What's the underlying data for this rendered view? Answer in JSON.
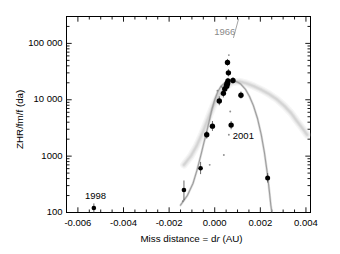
{
  "figure": {
    "background": "#ffffff",
    "frame_color": "#000000",
    "point_color": "#000000",
    "model_curve_dark": "#9a9a9a",
    "model_curve_light": "#cfcfcf"
  },
  "chart_data": {
    "type": "scatter",
    "title": "",
    "xlabel": "Miss distance = dr (AU)",
    "xlabel_parts": {
      "pre": "Miss distance = d",
      "italic": "r",
      "post": " (AU)"
    },
    "ylabel": "ZHR/fm/f (da)",
    "xscale": "linear",
    "yscale": "log",
    "xlim": [
      -0.0065,
      0.0042
    ],
    "ylim": [
      100,
      300000
    ],
    "grid": false,
    "legend": "none",
    "xticks": [
      -0.006,
      -0.004,
      -0.002,
      0.0,
      0.002,
      0.004
    ],
    "xticklabels": [
      "-0.006",
      "-0.004",
      "-0.002",
      "0.000",
      "0.002",
      "0.004"
    ],
    "x_minor_per_major": 4,
    "yticks": [
      100,
      1000,
      10000,
      100000
    ],
    "yticklabels": [
      "100",
      "1000",
      "10 000",
      "100 000"
    ],
    "tick_direction": "in",
    "series": [
      {
        "name": "Observed storms (ZHR measurements)",
        "marker": "filled circle",
        "color": "#000000",
        "points": [
          {
            "x": -0.0053,
            "y": 120,
            "size": 4.6,
            "err_lo": 100,
            "err_hi": 145
          },
          {
            "x": -0.00135,
            "y": 250,
            "size": 4.6,
            "err_lo": 165,
            "err_hi": 370
          },
          {
            "x": -0.00062,
            "y": 610,
            "size": 4.6,
            "err_lo": 480,
            "err_hi": 790
          },
          {
            "x": -0.00035,
            "y": 2400,
            "size": 5.4,
            "err_lo": 2050,
            "err_hi": 2800
          },
          {
            "x": -0.0001,
            "y": 3400,
            "size": 5.4,
            "err_lo": 2800,
            "err_hi": 4200
          },
          {
            "x": 0.0002,
            "y": 9500,
            "size": 5.4,
            "err_lo": 8000,
            "err_hi": 11500
          },
          {
            "x": 0.00038,
            "y": 13000,
            "size": 5.4,
            "err_lo": 11000,
            "err_hi": 15500
          },
          {
            "x": 0.00044,
            "y": 15500,
            "size": 5.4,
            "err_lo": 13500,
            "err_hi": 18000
          },
          {
            "x": 0.00052,
            "y": 17500,
            "size": 6.0,
            "err_lo": 15000,
            "err_hi": 20500
          },
          {
            "x": 0.00055,
            "y": 19500,
            "size": 6.0,
            "err_lo": 17000,
            "err_hi": 22500
          },
          {
            "x": 0.00058,
            "y": 21500,
            "size": 5.4,
            "err_lo": 19000,
            "err_hi": 24500
          },
          {
            "x": 0.0006,
            "y": 30000,
            "size": 5.4,
            "err_lo": 26000,
            "err_hi": 35000
          },
          {
            "x": 0.00056,
            "y": 46000,
            "size": 5.4,
            "err_lo": 40000,
            "err_hi": 53000
          },
          {
            "x": 0.0008,
            "y": 22000,
            "size": 5.4,
            "err_lo": 19500,
            "err_hi": 25000
          },
          {
            "x": 0.00072,
            "y": 3550,
            "size": 5.4,
            "err_lo": 3000,
            "err_hi": 4200
          },
          {
            "x": 0.00115,
            "y": 12000,
            "size": 5.4,
            "err_lo": 10500,
            "err_hi": 14000
          },
          {
            "x": 0.00232,
            "y": 410,
            "size": 5.0,
            "err_lo": 340,
            "err_hi": 500
          }
        ]
      },
      {
        "name": "Model points (small)",
        "marker": "small dot",
        "color": "#7d7d7d",
        "points": [
          {
            "x": 0.00062,
            "y": 62000
          },
          {
            "x": 0.0003,
            "y": 17000
          },
          {
            "x": 0.00012,
            "y": 14500
          },
          {
            "x": 0.00068,
            "y": 6200
          },
          {
            "x": 0.00062,
            "y": 2400
          },
          {
            "x": 0.0004,
            "y": 1050
          },
          {
            "x": -0.00022,
            "y": 700
          },
          {
            "x": -0.0014,
            "y": 158
          }
        ]
      }
    ],
    "model_curves": [
      {
        "name": "Dust trail model (narrow peak)",
        "style": "solid",
        "color": "#9a9a9a",
        "width": 1.1,
        "points": [
          [
            -0.0015,
            135
          ],
          [
            -0.0012,
            200
          ],
          [
            -0.00095,
            330
          ],
          [
            -0.00078,
            560
          ],
          [
            -0.00068,
            800
          ],
          [
            -0.00058,
            1150
          ],
          [
            -0.00048,
            1700
          ],
          [
            -0.00036,
            2600
          ],
          [
            -0.00024,
            4200
          ],
          [
            -0.00012,
            6800
          ],
          [
            0.0,
            10000
          ],
          [
            0.00014,
            14000
          ],
          [
            0.00028,
            17500
          ],
          [
            0.00044,
            20000
          ],
          [
            0.0006,
            21500
          ],
          [
            0.00078,
            22000
          ],
          [
            0.00096,
            21000
          ],
          [
            0.00114,
            19000
          ],
          [
            0.00134,
            15500
          ],
          [
            0.00152,
            11500
          ],
          [
            0.0017,
            7800
          ],
          [
            0.00188,
            4600
          ],
          [
            0.00204,
            2400
          ],
          [
            0.00218,
            1150
          ],
          [
            0.0023,
            520
          ],
          [
            0.0024,
            230
          ],
          [
            0.00246,
            135
          ],
          [
            0.0025,
            105
          ]
        ]
      },
      {
        "name": "Dust trail model (broad diffuse band)",
        "style": "solid diffuse",
        "color": "#cfcfcf",
        "width": 3.4,
        "points": [
          [
            -0.00135,
            700
          ],
          [
            -0.00105,
            1000
          ],
          [
            -0.0008,
            1500
          ],
          [
            -0.00055,
            2500
          ],
          [
            -0.0003,
            4500
          ],
          [
            -5e-05,
            8000
          ],
          [
            0.0002,
            12500
          ],
          [
            0.00048,
            17000
          ],
          [
            0.00078,
            20500
          ],
          [
            0.0011,
            21000
          ],
          [
            0.0014,
            19500
          ],
          [
            0.0017,
            17500
          ],
          [
            0.00205,
            15000
          ],
          [
            0.0024,
            12500
          ],
          [
            0.00275,
            10000
          ],
          [
            0.00305,
            7800
          ],
          [
            0.00335,
            5800
          ],
          [
            0.0036,
            4200
          ],
          [
            0.00385,
            3100
          ],
          [
            0.00405,
            2400
          ]
        ]
      }
    ],
    "annotations": [
      {
        "text": "1966",
        "color": "#8a8a8a",
        "x": 0.0005,
        "y": 150000,
        "leader": {
          "from_x": 0.00082,
          "from_y": 125000,
          "to_x": 0.00105,
          "to_y": 275000
        }
      },
      {
        "text": "2001",
        "color": "#000000",
        "x": 0.00088,
        "y": 2200,
        "leader": null
      },
      {
        "text": "1998",
        "color": "#000000",
        "x": -0.0056,
        "y": 190,
        "leader": null
      }
    ]
  }
}
